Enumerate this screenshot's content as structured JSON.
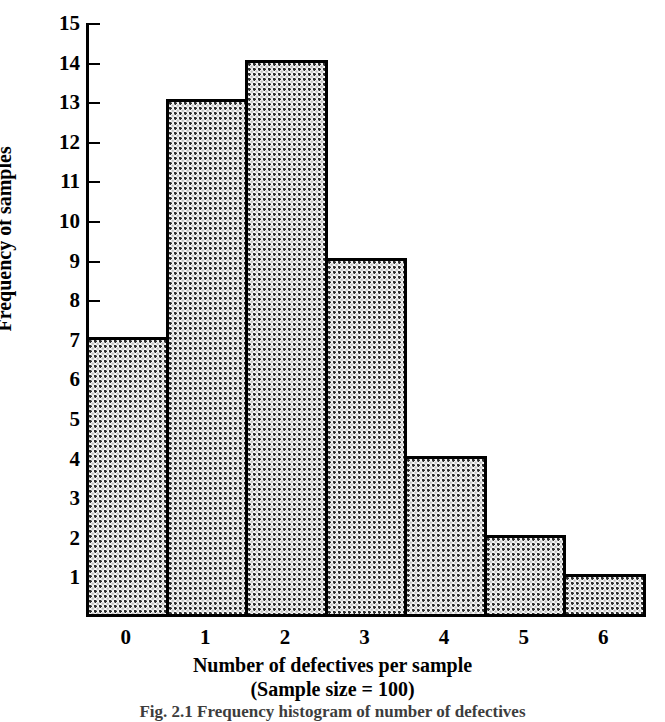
{
  "chart_data": {
    "type": "bar",
    "title": "",
    "subtitle": "",
    "xlabel": "Number of defectives per sample",
    "xlabel_line2": "(Sample size = 100)",
    "ylabel": "Frequency of samples",
    "categories": [
      "0",
      "1",
      "2",
      "3",
      "4",
      "5",
      "6"
    ],
    "values": [
      7,
      13,
      14,
      9,
      4,
      2,
      1
    ],
    "xlim": [
      -0.5,
      6.5
    ],
    "ylim": [
      0,
      15
    ],
    "ytick_labels": [
      "1",
      "2",
      "3",
      "4",
      "5",
      "6",
      "7",
      "8",
      "9",
      "10",
      "11",
      "12",
      "13",
      "14",
      "15"
    ],
    "ytick_values": [
      1,
      2,
      3,
      4,
      5,
      6,
      7,
      8,
      9,
      10,
      11,
      12,
      13,
      14,
      15
    ],
    "grid": false,
    "legend": false,
    "legend_position": "none",
    "bar_fill": "stipple-dot-pattern",
    "bar_edge_color": "#000000",
    "bar_face_color": "#fbfbfb",
    "axis_color": "#000000",
    "background_color": "#ffffff"
  },
  "caption": {
    "text": "Fig. 2.1  Frequency histogram of number of defectives"
  }
}
